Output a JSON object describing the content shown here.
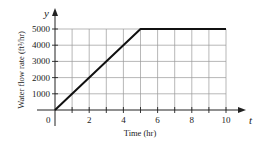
{
  "chart_data": {
    "type": "line",
    "title": "",
    "xlabel": "Time (hr)",
    "ylabel": "Water flow rate (ft³/hr)",
    "xvar": "t",
    "yvar": "y",
    "origin_label": "0",
    "xlim": [
      0,
      10
    ],
    "ylim": [
      0,
      5000
    ],
    "xticks": [
      1,
      2,
      3,
      4,
      5,
      6,
      7,
      8,
      9,
      10
    ],
    "xtick_labels": [
      "2",
      "4",
      "6",
      "8",
      "10"
    ],
    "xtick_label_values": [
      2,
      4,
      6,
      8,
      10
    ],
    "yticks": [
      1000,
      2000,
      3000,
      4000,
      5000
    ],
    "ytick_labels": [
      "1000",
      "2000",
      "3000",
      "4000",
      "5000"
    ],
    "grid": true,
    "series": [
      {
        "name": "water flow rate",
        "x": [
          0,
          5,
          10
        ],
        "y": [
          0,
          5000,
          5000
        ],
        "color": "#111111"
      }
    ]
  }
}
